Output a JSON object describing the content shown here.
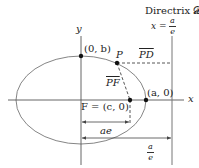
{
  "diagram": {
    "colors": {
      "stroke": "#555555",
      "ellipse": "#777777",
      "text": "#222222",
      "dot": "#111111",
      "background": "#ffffff"
    },
    "directrix": {
      "title": "Directrix 𝓓",
      "equation_lhs": "x =",
      "equation_num": "a",
      "equation_den": "e"
    },
    "axes": {
      "x_label": "x",
      "y_label": "y"
    },
    "points": {
      "top_vertex": "(0, b)",
      "point_p": "P",
      "focus": "F = (c, 0)",
      "right_vertex": "(a, 0)"
    },
    "segments": {
      "pd": "PD",
      "pf": "PF"
    },
    "distances": {
      "ae": "ae",
      "a_over_e_num": "a",
      "a_over_e_den": "e"
    }
  }
}
